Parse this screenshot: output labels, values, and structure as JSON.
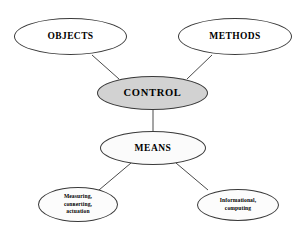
{
  "diagram": {
    "background_color": "#ffffff",
    "edge_color": "#4a4a4a",
    "node_border_color": "#3a3a3a",
    "nodes": {
      "objects": {
        "label": "OBJECTS",
        "fill": "#ffffff"
      },
      "methods": {
        "label": "METHODS",
        "fill": "#ffffff"
      },
      "control": {
        "label": "CONTROL",
        "fill": "#d2d2d2"
      },
      "means": {
        "label": "MEANS",
        "fill": "#fbfbfb"
      },
      "measuring": {
        "label": "Measuring,\nconвerting,\nactuation",
        "fill": "#fcfcfc"
      },
      "informational": {
        "label": "Informational,\ncomputing",
        "fill": "#fcfcfc"
      }
    },
    "edges": [
      {
        "from": "objects",
        "to": "control"
      },
      {
        "from": "methods",
        "to": "control"
      },
      {
        "from": "control",
        "to": "means"
      },
      {
        "from": "means",
        "to": "measuring"
      },
      {
        "from": "means",
        "to": "informational"
      }
    ]
  }
}
